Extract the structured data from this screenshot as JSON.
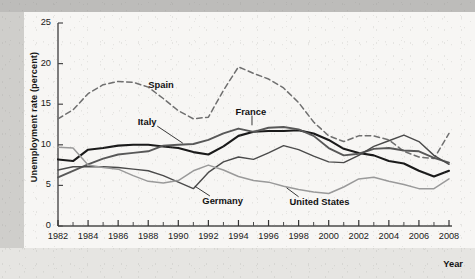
{
  "figure": {
    "y_axis_title": "Unemployment rate (percent)",
    "x_axis_title": "Year"
  },
  "chart_data": {
    "type": "line",
    "title": "",
    "xlabel": "Year",
    "ylabel": "Unemployment rate (percent)",
    "xlim": [
      1982,
      2008
    ],
    "ylim": [
      0,
      25
    ],
    "ytick_labels": [
      "0",
      "5",
      "10",
      "15",
      "20",
      "25"
    ],
    "yticks": [
      0,
      5,
      10,
      15,
      20,
      25
    ],
    "xtick_labels": [
      "1982",
      "1984",
      "1986",
      "1988",
      "1990",
      "1992",
      "1994",
      "1996",
      "1998",
      "2000",
      "2002",
      "2004",
      "2006",
      "2008"
    ],
    "xticks": [
      1982,
      1984,
      1986,
      1988,
      1990,
      1992,
      1994,
      1996,
      1998,
      2000,
      2002,
      2004,
      2006,
      2008
    ],
    "minor_xticks": [
      1983,
      1985,
      1987,
      1989,
      1991,
      1993,
      1995,
      1997,
      1999,
      2001,
      2003,
      2005,
      2007
    ],
    "grid": false,
    "legend_position": "inline-annotations",
    "x": [
      1982,
      1983,
      1984,
      1985,
      1986,
      1987,
      1988,
      1989,
      1990,
      1991,
      1992,
      1993,
      1994,
      1995,
      1996,
      1997,
      1998,
      1999,
      2000,
      2001,
      2002,
      2003,
      2004,
      2005,
      2006,
      2007,
      2008
    ],
    "series": [
      {
        "name": "Spain",
        "color": "#6f6f6f",
        "style": "dashed",
        "width": 1.5,
        "label_x": 1988.0,
        "label_y": 17.4,
        "values": [
          13.2,
          14.3,
          16.3,
          17.4,
          17.8,
          17.7,
          17.1,
          15.7,
          14.2,
          13.2,
          13.4,
          16.7,
          19.6,
          18.8,
          18.1,
          17.0,
          15.2,
          12.8,
          11.1,
          10.4,
          11.1,
          11.1,
          10.6,
          9.2,
          8.5,
          8.3,
          11.4
        ]
      },
      {
        "name": "Italy",
        "color": "#1a1a1a",
        "style": "solid",
        "width": 2.1,
        "label_x": 1987.3,
        "label_y": 12.8,
        "values": [
          8.2,
          8.0,
          9.4,
          9.6,
          9.9,
          10.0,
          10.0,
          9.8,
          9.6,
          9.1,
          8.8,
          9.8,
          11.1,
          11.6,
          11.7,
          11.7,
          11.8,
          11.4,
          10.6,
          9.5,
          9.0,
          8.7,
          8.0,
          7.7,
          6.8,
          6.1,
          6.8
        ]
      },
      {
        "name": "France",
        "color": "#585858",
        "style": "solid",
        "width": 1.9,
        "label_x": 1993.8,
        "label_y": 14.1,
        "values": [
          6.0,
          6.8,
          7.6,
          8.3,
          8.8,
          9.0,
          9.2,
          9.9,
          10.0,
          10.1,
          10.6,
          11.4,
          12.0,
          11.6,
          12.1,
          12.2,
          11.9,
          11.1,
          9.6,
          8.7,
          8.9,
          9.5,
          9.6,
          9.3,
          9.2,
          8.4,
          7.8
        ]
      },
      {
        "name": "Germany",
        "color": "#4a4a4a",
        "style": "solid",
        "width": 1.4,
        "label_x": 1991.6,
        "label_y": 3.1,
        "values": [
          6.9,
          7.3,
          7.3,
          7.3,
          7.2,
          7.0,
          6.8,
          6.2,
          5.4,
          4.6,
          6.6,
          7.9,
          8.5,
          8.2,
          9.0,
          9.9,
          9.4,
          8.6,
          7.9,
          7.8,
          8.7,
          9.8,
          10.5,
          11.2,
          10.4,
          8.7,
          7.6
        ]
      },
      {
        "name": "United States",
        "color": "#9a9a9a",
        "style": "solid",
        "width": 1.5,
        "label_x": 1997.4,
        "label_y": 3.0,
        "values": [
          9.7,
          9.6,
          7.5,
          7.2,
          7.0,
          6.2,
          5.5,
          5.3,
          5.6,
          6.8,
          7.5,
          6.9,
          6.1,
          5.6,
          5.4,
          4.9,
          4.5,
          4.2,
          4.0,
          4.8,
          5.8,
          6.0,
          5.5,
          5.1,
          4.6,
          4.6,
          5.8
        ]
      }
    ],
    "annotations": [
      {
        "series": "Spain",
        "text": "Spain"
      },
      {
        "series": "Italy",
        "text": "Italy"
      },
      {
        "series": "France",
        "text": "France"
      },
      {
        "series": "Germany",
        "text": "Germany"
      },
      {
        "series": "United States",
        "text": "United States"
      }
    ]
  },
  "label_leaders": [
    {
      "name": "Italy",
      "x1": 1988.6,
      "y1": 12.3,
      "x2": 1990.3,
      "y2": 10.2
    },
    {
      "name": "France",
      "x1": 1994.9,
      "y1": 13.6,
      "x2": 1994.9,
      "y2": 12.4
    },
    {
      "name": "Germany",
      "x1": 1992.1,
      "y1": 3.7,
      "x2": 1991.1,
      "y2": 4.9
    },
    {
      "name": "United States",
      "x1": 1998.0,
      "y1": 3.6,
      "x2": 1997.2,
      "y2": 4.7
    }
  ]
}
